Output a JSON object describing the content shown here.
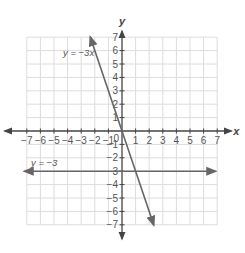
{
  "chart_data": {
    "type": "line",
    "title": "",
    "xlabel": "x",
    "ylabel": "y",
    "xlim": [
      -7,
      7
    ],
    "ylim": [
      -7,
      7
    ],
    "grid": true,
    "legend": "none",
    "x_ticks": [
      -7,
      -6,
      -5,
      -4,
      -3,
      -2,
      -1,
      1,
      2,
      3,
      4,
      5,
      6,
      7
    ],
    "y_ticks": [
      7,
      6,
      5,
      4,
      3,
      2,
      1,
      -1,
      -2,
      -3,
      -4,
      -5,
      -6,
      -7
    ],
    "origin_label": "0",
    "series": [
      {
        "name": "y = −3x",
        "label": "y = −3x",
        "equation": "y = -3x",
        "slope": -3,
        "intercept": 0,
        "points": [
          [
            -2.33,
            7
          ],
          [
            0,
            0
          ],
          [
            2.33,
            -7
          ]
        ],
        "color": "#666666"
      },
      {
        "name": "y = −3",
        "label": "y = −3",
        "equation": "y = -3",
        "slope": 0,
        "intercept": -3,
        "points": [
          [
            -7,
            -3
          ],
          [
            7,
            -3
          ]
        ],
        "color": "#666666"
      }
    ],
    "intersection": [
      1,
      -3
    ],
    "annotations": [
      {
        "text": "y = −3x",
        "near": [
          -2.6,
          6
        ]
      },
      {
        "text": "y = −3",
        "near": [
          -6.5,
          -2.3
        ]
      }
    ]
  },
  "colors": {
    "grid": "#dcdcdc",
    "axis": "#444444",
    "line": "#666666",
    "text": "#555555"
  }
}
